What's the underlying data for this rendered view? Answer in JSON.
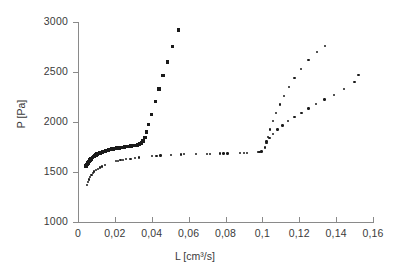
{
  "chart_data": {
    "type": "scatter",
    "title": "",
    "xlabel": "L [cm³/s]",
    "ylabel": "P [Pa]",
    "xlim": [
      0,
      0.16
    ],
    "ylim": [
      1000,
      3000
    ],
    "xticks": [
      0,
      0.02,
      0.04,
      0.06,
      0.08,
      0.1,
      0.12,
      0.14,
      0.16
    ],
    "xtick_labels": [
      "0",
      "0,02",
      "0,04",
      "0,06",
      "0,08",
      "0,1",
      "0,12",
      "0,14",
      "0,16"
    ],
    "yticks": [
      1000,
      1500,
      2000,
      2500,
      3000
    ],
    "ytick_labels": [
      "1000",
      "1500",
      "2000",
      "2500",
      "3000"
    ],
    "grid": false,
    "legend": "none",
    "decimal_separator": ",",
    "series": [
      {
        "name": "series-1-square-markers",
        "marker": "square",
        "color": "#1a1a1a",
        "points": [
          [
            0.0045,
            1558
          ],
          [
            0.005,
            1576
          ],
          [
            0.0055,
            1592
          ],
          [
            0.006,
            1607
          ],
          [
            0.0066,
            1620
          ],
          [
            0.0072,
            1632
          ],
          [
            0.0078,
            1643
          ],
          [
            0.0084,
            1653
          ],
          [
            0.009,
            1662
          ],
          [
            0.0097,
            1670
          ],
          [
            0.0104,
            1678
          ],
          [
            0.0111,
            1685
          ],
          [
            0.0118,
            1691
          ],
          [
            0.0125,
            1697
          ],
          [
            0.0133,
            1702
          ],
          [
            0.0141,
            1707
          ],
          [
            0.0149,
            1712
          ],
          [
            0.0157,
            1716
          ],
          [
            0.0165,
            1720
          ],
          [
            0.0174,
            1724
          ],
          [
            0.0183,
            1728
          ],
          [
            0.0192,
            1731
          ],
          [
            0.0201,
            1735
          ],
          [
            0.0211,
            1738
          ],
          [
            0.0221,
            1741
          ],
          [
            0.0231,
            1744
          ],
          [
            0.0241,
            1747
          ],
          [
            0.0252,
            1750
          ],
          [
            0.0263,
            1753
          ],
          [
            0.0274,
            1756
          ],
          [
            0.0286,
            1759
          ],
          [
            0.0298,
            1763
          ],
          [
            0.031,
            1767
          ],
          [
            0.0322,
            1772
          ],
          [
            0.0333,
            1779
          ],
          [
            0.0344,
            1790
          ],
          [
            0.0354,
            1810
          ],
          [
            0.0363,
            1846
          ],
          [
            0.0372,
            1900
          ],
          [
            0.0382,
            1975
          ],
          [
            0.0398,
            2075
          ],
          [
            0.042,
            2205
          ],
          [
            0.044,
            2330
          ],
          [
            0.046,
            2465
          ],
          [
            0.0485,
            2600
          ],
          [
            0.0512,
            2755
          ],
          [
            0.0545,
            2920
          ]
        ]
      },
      {
        "name": "series-2-dot-markers-mid",
        "marker": "dot",
        "color": "#1a1a1a",
        "points": [
          [
            0.005,
            1370
          ],
          [
            0.0055,
            1398
          ],
          [
            0.006,
            1425
          ],
          [
            0.0066,
            1450
          ],
          [
            0.0073,
            1472
          ],
          [
            0.008,
            1490
          ],
          [
            0.0088,
            1506
          ],
          [
            0.0097,
            1520
          ],
          [
            0.0107,
            1533
          ],
          [
            0.0118,
            1545
          ],
          [
            0.013,
            1556
          ],
          [
            0.0145,
            1568
          ],
          [
            0.0205,
            1608
          ],
          [
            0.0218,
            1613
          ],
          [
            0.0231,
            1618
          ],
          [
            0.0245,
            1622
          ],
          [
            0.0262,
            1627
          ],
          [
            0.0285,
            1633
          ],
          [
            0.031,
            1639
          ],
          [
            0.0332,
            1644
          ],
          [
            0.0402,
            1658
          ],
          [
            0.0425,
            1661
          ],
          [
            0.0448,
            1664
          ],
          [
            0.0505,
            1671
          ],
          [
            0.056,
            1676
          ],
          [
            0.0575,
            1677
          ],
          [
            0.064,
            1680
          ],
          [
            0.07,
            1682
          ],
          [
            0.0715,
            1683
          ],
          [
            0.077,
            1685
          ],
          [
            0.079,
            1686
          ],
          [
            0.081,
            1686
          ],
          [
            0.088,
            1690
          ],
          [
            0.09,
            1691
          ],
          [
            0.0918,
            1691
          ],
          [
            0.0975,
            1700
          ],
          [
            0.0985,
            1702
          ],
          [
            0.0995,
            1706
          ],
          [
            0.1015,
            1745
          ],
          [
            0.1022,
            1790
          ],
          [
            0.103,
            1850
          ],
          [
            0.1042,
            1925
          ],
          [
            0.1058,
            2010
          ],
          [
            0.1075,
            2090
          ],
          [
            0.1095,
            2175
          ],
          [
            0.1118,
            2260
          ],
          [
            0.1145,
            2350
          ],
          [
            0.1175,
            2440
          ],
          [
            0.121,
            2530
          ],
          [
            0.125,
            2620
          ],
          [
            0.1295,
            2700
          ],
          [
            0.134,
            2760
          ]
        ]
      },
      {
        "name": "series-3-dot-markers-right",
        "marker": "dot",
        "color": "#1a1a1a",
        "points": [
          [
            0.1022,
            1805
          ],
          [
            0.1038,
            1840
          ],
          [
            0.1058,
            1882
          ],
          [
            0.1082,
            1925
          ],
          [
            0.111,
            1965
          ],
          [
            0.114,
            2008
          ],
          [
            0.1175,
            2050
          ],
          [
            0.1212,
            2092
          ],
          [
            0.125,
            2135
          ],
          [
            0.1292,
            2178
          ],
          [
            0.1338,
            2225
          ],
          [
            0.1388,
            2272
          ],
          [
            0.1442,
            2330
          ],
          [
            0.15,
            2400
          ],
          [
            0.1522,
            2470
          ]
        ]
      }
    ]
  },
  "axis": {
    "y_title": "P [Pa]",
    "x_title": "L [cm³/s]"
  }
}
